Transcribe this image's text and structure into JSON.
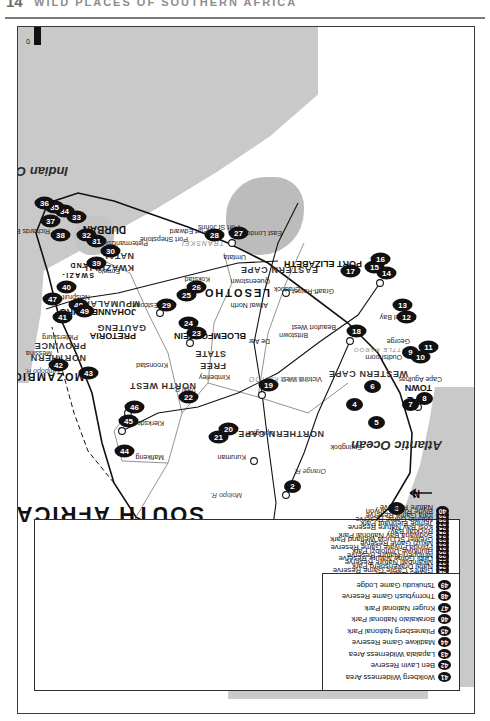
{
  "page": {
    "folio": "14",
    "running_head": "WILD PLACES OF SOUTHERN AFRICA"
  },
  "map": {
    "title": "SOUTH AFRICA",
    "scale": {
      "unit": "km",
      "ticks": [
        "0",
        "100",
        "200",
        "300"
      ]
    },
    "north_arrow_label": "N",
    "oceans": [
      {
        "name": "Indian Ocean"
      },
      {
        "name": "Atlantic Ocean"
      }
    ],
    "countries": [
      {
        "name": "NAMIBIA"
      },
      {
        "name": "BOTSWANA"
      },
      {
        "name": "MOZAMBIQUE"
      },
      {
        "name": "ZIMBABWE"
      },
      {
        "name": "LESOTHO"
      },
      {
        "name": "SWAZI-"
      },
      {
        "name": "LAND"
      }
    ],
    "provinces": [
      {
        "name": "NORTHERN"
      },
      {
        "name": "PROVINCE"
      },
      {
        "name": "GAUTENG"
      },
      {
        "name": "MPUMALANGA"
      },
      {
        "name": "NORTH WEST"
      },
      {
        "name": "FREE"
      },
      {
        "name": "STATE"
      },
      {
        "name": "KWAZULU-"
      },
      {
        "name": "NATAL"
      },
      {
        "name": "NORTHERN CAPE"
      },
      {
        "name": "EASTERN CAPE"
      },
      {
        "name": "WESTERN CAPE"
      }
    ],
    "cities": [
      {
        "name": "PRETORIA"
      },
      {
        "name": "JOHANNESBURG"
      },
      {
        "name": "BLOEMFONTEIN"
      },
      {
        "name": "DURBAN"
      },
      {
        "name": "CAPE"
      },
      {
        "name": "TOWN"
      },
      {
        "name": "PORT ELIZABETH"
      }
    ],
    "towns": [
      {
        "name": "Messina"
      },
      {
        "name": "Pietersburg"
      },
      {
        "name": "Nelspruit"
      },
      {
        "name": "Klerksdorp"
      },
      {
        "name": "Mafikeng"
      },
      {
        "name": "Kuruman"
      },
      {
        "name": "Upington"
      },
      {
        "name": "Springbok"
      },
      {
        "name": "Kimberley"
      },
      {
        "name": "Kroonstad"
      },
      {
        "name": "De Aar"
      },
      {
        "name": "Britstown"
      },
      {
        "name": "Victoria West"
      },
      {
        "name": "Beaufort West"
      },
      {
        "name": "Oudtshoorn"
      },
      {
        "name": "George"
      },
      {
        "name": "Mossel Bay"
      },
      {
        "name": "Cape Agulhas"
      },
      {
        "name": "Graaff-Reinet"
      },
      {
        "name": "Cradock"
      },
      {
        "name": "Aliwal North"
      },
      {
        "name": "Queenstown"
      },
      {
        "name": "East London"
      },
      {
        "name": "Umtata"
      },
      {
        "name": "Port St Johns"
      },
      {
        "name": "Port Edward"
      },
      {
        "name": "Port Shepstone"
      },
      {
        "name": "Kokstad"
      },
      {
        "name": "Estcourt"
      },
      {
        "name": "Pietermaritzburg"
      },
      {
        "name": "Richards Bay"
      },
      {
        "name": "Ermelo"
      }
    ],
    "regions": [
      {
        "name": "GREAT KAROO"
      },
      {
        "name": "LITTLE KAROO"
      },
      {
        "name": "TRANSKEI"
      }
    ],
    "rivers": [
      {
        "name": "Limpopo R."
      },
      {
        "name": "Molopo R."
      },
      {
        "name": "Orange R."
      },
      {
        "name": "Vaal R."
      }
    ]
  },
  "legend_main": {
    "items": [
      {
        "num": "1",
        "label": "Kalahari Gemsbok Park"
      },
      {
        "num": "2",
        "label": "Augrabies Falls National Park"
      },
      {
        "num": "3",
        "label": "Richtersveld National Park"
      },
      {
        "num": "4",
        "label": "Tankwa Karoo National Park"
      },
      {
        "num": "5",
        "label": "Cederberg Wilderness Area"
      },
      {
        "num": "6",
        "label": "Groot Winterhoek"
      },
      {
        "num": "",
        "label": "Wilderness Area"
      },
      {
        "num": "7",
        "label": "West Coast National Park"
      },
      {
        "num": "8",
        "label": "Cape of Good Hope"
      },
      {
        "num": "",
        "label": "Nature Reserve"
      },
      {
        "num": "9",
        "label": "Bontebok National Park"
      },
      {
        "num": "10",
        "label": "Marloth Nature Reserve"
      },
      {
        "num": "11",
        "label": "De Hoop Nature Reserve"
      },
      {
        "num": "12",
        "label": "Wilderness National Park"
      },
      {
        "num": "13",
        "label": "Tsitsikamma National Park"
      },
      {
        "num": "14",
        "label": "Addo Elephant National Park"
      },
      {
        "num": "15",
        "label": "Zuurberg National Park"
      },
      {
        "num": "16",
        "label": "Shamwari Game Reserve"
      },
      {
        "num": "17",
        "label": "Mountain Zebra National Park"
      },
      {
        "num": "18",
        "label": "Karoo National Park"
      },
      {
        "num": "19",
        "label": "Vaalbos National Park"
      },
      {
        "num": "20",
        "label": "Sandveld Nature Reserve"
      },
      {
        "num": "21",
        "label": "Bloemhof Dam Nature Reserve"
      },
      {
        "num": "22",
        "label": "Willem Pretorius Game Reserve"
      },
      {
        "num": "23",
        "label": "Golden Gate Highlands"
      },
      {
        "num": "",
        "label": "National Park"
      },
      {
        "num": "24",
        "label": "Royal Natal Park"
      },
      {
        "num": "25",
        "label": "Giant's Castle Game Reserve"
      },
      {
        "num": "26",
        "label": "Natal Drakensberg Park"
      },
      {
        "num": "27",
        "label": "Mkambati Nature Reserve"
      },
      {
        "num": "28",
        "label": "Oribi Gorge Nature Reserve"
      },
      {
        "num": "29",
        "label": "Mhlopeni Nature Reserve"
      },
      {
        "num": "30",
        "label": "Hluhluwe-Umfolozi Park"
      },
      {
        "num": "31",
        "label": "Phinda Private Game Reserve"
      },
      {
        "num": "32",
        "label": "Mkuzi Game Reserve"
      },
      {
        "num": "33",
        "label": "Greater St Lucia Wetland Park"
      },
      {
        "num": "34",
        "label": "Sodwana Bay National Park"
      },
      {
        "num": "35",
        "label": "Rocktail Bay"
      },
      {
        "num": "36",
        "label": "Kosi Bay Nature Reserve"
      },
      {
        "num": "37",
        "label": "Tembe Elephant Park"
      },
      {
        "num": "38",
        "label": "Ndumo Game Reserve"
      },
      {
        "num": "39",
        "label": "Itala Game Reserve"
      },
      {
        "num": "40",
        "label": "Blyde River Canyon"
      },
      {
        "num": "",
        "label": "Nature Reserve"
      }
    ]
  },
  "legend_secondary": {
    "items": [
      {
        "num": "41",
        "label": "Wolkberg Wilderness Area"
      },
      {
        "num": "42",
        "label": "Ben Lavin Reserve"
      },
      {
        "num": "43",
        "label": "Lapalala Wilderness Area"
      },
      {
        "num": "44",
        "label": "Madikwe Game Reserve"
      },
      {
        "num": "45",
        "label": "Pilanesberg National Park"
      },
      {
        "num": "46",
        "label": "Borakalalo National Park"
      },
      {
        "num": "47",
        "label": "Kruger National Park"
      },
      {
        "num": "48",
        "label": "Thornybush Game Reserve"
      },
      {
        "num": "49",
        "label": "Tshukudu Game Lodge"
      }
    ]
  },
  "map_pins": [
    {
      "num": "1",
      "x": 120,
      "y": 196
    },
    {
      "num": "2",
      "x": 218,
      "y": 268
    },
    {
      "num": "3",
      "x": 196,
      "y": 372
    },
    {
      "num": "4",
      "x": 300,
      "y": 330
    },
    {
      "num": "5",
      "x": 282,
      "y": 352
    },
    {
      "num": "6",
      "x": 318,
      "y": 348
    },
    {
      "num": "7",
      "x": 300,
      "y": 386
    },
    {
      "num": "8",
      "x": 306,
      "y": 400
    },
    {
      "num": "9",
      "x": 352,
      "y": 386
    },
    {
      "num": "10",
      "x": 346,
      "y": 396
    },
    {
      "num": "11",
      "x": 356,
      "y": 404
    },
    {
      "num": "12",
      "x": 386,
      "y": 382
    },
    {
      "num": "13",
      "x": 398,
      "y": 378
    },
    {
      "num": "14",
      "x": 430,
      "y": 362
    },
    {
      "num": "15",
      "x": 436,
      "y": 350
    },
    {
      "num": "16",
      "x": 444,
      "y": 356
    },
    {
      "num": "17",
      "x": 432,
      "y": 326
    },
    {
      "num": "18",
      "x": 372,
      "y": 332
    },
    {
      "num": "19",
      "x": 318,
      "y": 244
    },
    {
      "num": "20",
      "x": 274,
      "y": 204
    },
    {
      "num": "21",
      "x": 266,
      "y": 194
    },
    {
      "num": "22",
      "x": 306,
      "y": 164
    },
    {
      "num": "23",
      "x": 370,
      "y": 172
    },
    {
      "num": "24",
      "x": 380,
      "y": 164
    },
    {
      "num": "25",
      "x": 408,
      "y": 162
    },
    {
      "num": "26",
      "x": 416,
      "y": 172
    },
    {
      "num": "27",
      "x": 470,
      "y": 214
    },
    {
      "num": "28",
      "x": 468,
      "y": 190
    },
    {
      "num": "29",
      "x": 398,
      "y": 142
    },
    {
      "num": "30",
      "x": 452,
      "y": 86
    },
    {
      "num": "31",
      "x": 462,
      "y": 72
    },
    {
      "num": "32",
      "x": 468,
      "y": 62
    },
    {
      "num": "33",
      "x": 486,
      "y": 52
    },
    {
      "num": "34",
      "x": 492,
      "y": 40
    },
    {
      "num": "35",
      "x": 496,
      "y": 30
    },
    {
      "num": "36",
      "x": 500,
      "y": 20
    },
    {
      "num": "37",
      "x": 482,
      "y": 26
    },
    {
      "num": "38",
      "x": 468,
      "y": 36
    },
    {
      "num": "39",
      "x": 440,
      "y": 72
    },
    {
      "num": "40",
      "x": 416,
      "y": 42
    },
    {
      "num": "41",
      "x": 386,
      "y": 38
    },
    {
      "num": "42",
      "x": 338,
      "y": 34
    },
    {
      "num": "43",
      "x": 330,
      "y": 64
    },
    {
      "num": "44",
      "x": 252,
      "y": 100
    },
    {
      "num": "45",
      "x": 282,
      "y": 104
    },
    {
      "num": "46",
      "x": 296,
      "y": 110
    },
    {
      "num": "47",
      "x": 404,
      "y": 28
    },
    {
      "num": "48",
      "x": 398,
      "y": 54
    },
    {
      "num": "49",
      "x": 392,
      "y": 60
    }
  ]
}
